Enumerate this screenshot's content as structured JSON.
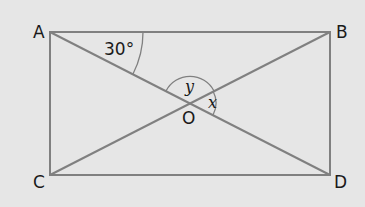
{
  "diagram": {
    "type": "geometry",
    "shape": "rectangle with diagonals",
    "colors": {
      "background": "#e6e6e6",
      "line": "#808080",
      "text": "#1a1a1a"
    },
    "vertices": {
      "A": {
        "label": "A",
        "x": 50,
        "y": 32
      },
      "B": {
        "label": "B",
        "x": 330,
        "y": 32
      },
      "C": {
        "label": "C",
        "x": 50,
        "y": 175
      },
      "D": {
        "label": "D",
        "x": 330,
        "y": 175
      },
      "O": {
        "label": "O",
        "x": 190,
        "y": 103
      }
    },
    "angles": {
      "at_A": {
        "label": "30°"
      },
      "y": {
        "label": "y"
      },
      "x": {
        "label": "x"
      }
    }
  }
}
